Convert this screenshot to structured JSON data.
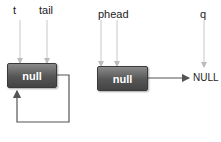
{
  "diagram": {
    "left": {
      "pointers": [
        {
          "label": "t"
        },
        {
          "label": "tail"
        }
      ],
      "node": {
        "value": "null"
      },
      "self_loop": true
    },
    "right": {
      "pointers": [
        {
          "label": "phead"
        },
        {
          "label": "q"
        }
      ],
      "node": {
        "value": "null"
      },
      "next_target": "NULL"
    }
  },
  "colors": {
    "node_fill": "#555555",
    "line": "#555555",
    "pointer_line": "#c8c8c8",
    "text": "#222222"
  }
}
